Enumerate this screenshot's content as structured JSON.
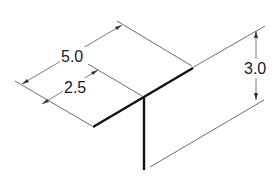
{
  "diagram": {
    "type": "isometric-dimension-drawing",
    "dimensions": {
      "length_full": "5.0",
      "length_half": "2.5",
      "height": "3.0"
    },
    "colors": {
      "part_stroke": "#111111",
      "dimension_stroke": "#6e6e6e",
      "text": "#1a1a1a",
      "background": "#ffffff"
    }
  }
}
